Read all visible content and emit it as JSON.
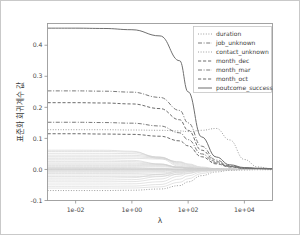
{
  "figure": {
    "background": "#ffffff",
    "border_color": "#c9c9c9"
  },
  "chart_data": {
    "type": "line",
    "title": "",
    "subtitle": "",
    "xlabel": "λ",
    "ylabel": "표준화 회귀계수 값",
    "xscale": "log",
    "xlim": [
      0.001,
      100000
    ],
    "ylim": [
      -0.1,
      0.47
    ],
    "xticks": [
      0.01,
      1,
      100,
      10000
    ],
    "xticklabels": [
      "1e-02",
      "1e+00",
      "1e+02",
      "1e+04"
    ],
    "yticks": [
      -0.1,
      0.0,
      0.1,
      0.2,
      0.3,
      0.4
    ],
    "yticklabels": [
      "-0.1",
      "0.0",
      "0.1",
      "0.2",
      "0.3",
      "0.4"
    ],
    "grid": false,
    "legend_position": "top-right",
    "series": [
      {
        "name": "duration",
        "linestyle": "dotted",
        "color": "#9e9e9e",
        "start_value": 0.128,
        "peak_value": 0.132,
        "peak_lambda": 1000,
        "end_value": 0.002,
        "x": [
          0.001,
          0.01,
          0.1,
          1,
          10,
          50,
          100,
          300,
          1000,
          3000,
          10000,
          30000,
          100000
        ],
        "y": [
          0.128,
          0.128,
          0.128,
          0.127,
          0.126,
          0.124,
          0.122,
          0.126,
          0.132,
          0.095,
          0.032,
          0.008,
          0.002
        ]
      },
      {
        "name": "job_unknown",
        "linestyle": "dashdot",
        "color": "#7a7a7a",
        "start_value": 0.253,
        "end_value": 0.002,
        "x": [
          0.001,
          0.01,
          0.1,
          1,
          10,
          50,
          100,
          300,
          1000,
          3000,
          10000,
          30000,
          100000
        ],
        "y": [
          0.253,
          0.253,
          0.252,
          0.249,
          0.232,
          0.19,
          0.15,
          0.075,
          0.03,
          0.012,
          0.005,
          0.003,
          0.002
        ]
      },
      {
        "name": "contact_unknown",
        "linestyle": "dotted",
        "color": "#9e9e9e",
        "start_value": -0.068,
        "end_value": -0.001,
        "x": [
          0.001,
          0.01,
          0.1,
          1,
          10,
          50,
          100,
          300,
          1000,
          3000,
          10000,
          30000,
          100000
        ],
        "y": [
          -0.068,
          -0.068,
          -0.068,
          -0.067,
          -0.063,
          -0.052,
          -0.04,
          -0.02,
          -0.008,
          -0.003,
          -0.002,
          -0.001,
          -0.001
        ]
      },
      {
        "name": "month_dec",
        "linestyle": "dashed",
        "color": "#6d6d6d",
        "start_value": 0.215,
        "end_value": 0.002,
        "x": [
          0.001,
          0.01,
          0.1,
          1,
          10,
          50,
          100,
          300,
          1000,
          3000,
          10000,
          30000,
          100000
        ],
        "y": [
          0.215,
          0.215,
          0.214,
          0.211,
          0.196,
          0.16,
          0.126,
          0.062,
          0.025,
          0.01,
          0.004,
          0.003,
          0.002
        ]
      },
      {
        "name": "month_mar",
        "linestyle": "dashdot",
        "color": "#7a7a7a",
        "start_value": 0.152,
        "end_value": 0.002,
        "x": [
          0.001,
          0.01,
          0.1,
          1,
          10,
          50,
          100,
          300,
          1000,
          3000,
          10000,
          30000,
          100000
        ],
        "y": [
          0.152,
          0.152,
          0.151,
          0.149,
          0.14,
          0.118,
          0.096,
          0.05,
          0.021,
          0.009,
          0.004,
          0.003,
          0.002
        ]
      },
      {
        "name": "month_oct",
        "linestyle": "dashed",
        "color": "#6d6d6d",
        "start_value": 0.115,
        "end_value": 0.002,
        "x": [
          0.001,
          0.01,
          0.1,
          1,
          10,
          50,
          100,
          300,
          1000,
          3000,
          10000,
          30000,
          100000
        ],
        "y": [
          0.115,
          0.115,
          0.114,
          0.113,
          0.107,
          0.092,
          0.076,
          0.041,
          0.018,
          0.008,
          0.004,
          0.003,
          0.002
        ]
      },
      {
        "name": "poutcome_success",
        "linestyle": "solid",
        "color": "#6f6f6f",
        "start_value": 0.455,
        "end_value": 0.003,
        "x": [
          0.001,
          0.01,
          0.1,
          1,
          10,
          50,
          100,
          300,
          1000,
          3000,
          10000,
          30000,
          100000
        ],
        "y": [
          0.455,
          0.455,
          0.454,
          0.45,
          0.43,
          0.35,
          0.25,
          0.105,
          0.04,
          0.015,
          0.006,
          0.004,
          0.003
        ]
      }
    ],
    "background_series_note": "many faint gray coefficient paths shrinking toward 0",
    "background_series_start_values": [
      0.062,
      0.058,
      0.052,
      0.046,
      0.041,
      0.036,
      0.031,
      0.026,
      0.021,
      0.017,
      0.013,
      0.009,
      0.006,
      0.004,
      0.002,
      0.001,
      0.0,
      -0.001,
      -0.003,
      -0.006,
      -0.009,
      -0.013,
      -0.018,
      -0.023,
      -0.028,
      -0.034,
      -0.04,
      -0.047,
      -0.054,
      -0.06
    ]
  },
  "legend": {
    "entries": [
      {
        "label": "duration"
      },
      {
        "label": "job_unknown"
      },
      {
        "label": "contact_unknown"
      },
      {
        "label": "month_dec"
      },
      {
        "label": "month_mar"
      },
      {
        "label": "month_oct"
      },
      {
        "label": "poutcome_success"
      }
    ]
  },
  "axes": {
    "x_title": "λ",
    "y_title": "표준화 회귀계수 값",
    "x_tick_labels": [
      "1e-02",
      "1e+00",
      "1e+02",
      "1e+04"
    ],
    "y_tick_labels": [
      "0.4",
      "0.3",
      "0.2",
      "0.1",
      "0.0",
      "-0.1"
    ]
  }
}
